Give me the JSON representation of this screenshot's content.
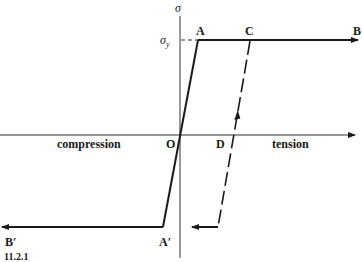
{
  "figure": {
    "axis_labels": {
      "y_axis": "σ",
      "yield_stress_symbol": "σ",
      "yield_stress_subscript": "y"
    },
    "point_labels": {
      "A": "A",
      "B": "B",
      "C": "C",
      "D": "D",
      "O": "O",
      "A_prime": "A′",
      "B_prime": "B′"
    },
    "region_labels": {
      "compression": "compression",
      "tension": "tension"
    },
    "caption_fragment": "11.2.1",
    "colors": {
      "line": "#1a1a1a",
      "axis": "#333333",
      "background": "#ffffff"
    }
  }
}
